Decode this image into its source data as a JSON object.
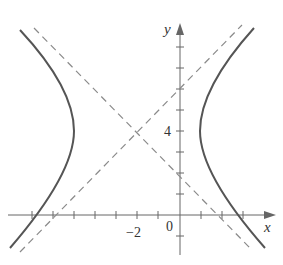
{
  "diagram": {
    "type": "hyperbola-graph",
    "equation": "(x+2)^2/9 - (y-4)^2/9 = 1",
    "center": [
      -2,
      4
    ],
    "a": 3,
    "b": 3,
    "asymptotes": [
      "y - 4 = x + 2",
      "y - 4 = -(x + 2)"
    ],
    "axes": {
      "x_label": "x",
      "y_label": "y",
      "origin_label": "0",
      "x_tick_label": "−2",
      "y_tick_label": "4",
      "x_range": [
        -8,
        4.5
      ],
      "y_range": [
        -1.6,
        9
      ]
    },
    "colors": {
      "curve": "#555555",
      "asymptote": "#8a8a8a",
      "axis": "#666666",
      "text": "#333333"
    }
  }
}
